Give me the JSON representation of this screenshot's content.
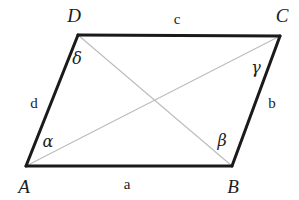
{
  "figure": {
    "background_color": "#ffffff",
    "edge_color": "#1a1a1a",
    "diagonal_color": "#b9b9b9",
    "label_color": "#1c1c1c"
  },
  "vertices": [
    {
      "name": "A",
      "label": "A",
      "x": 26,
      "y": 166,
      "label_x": 24,
      "label_y": 186
    },
    {
      "name": "B",
      "label": "B",
      "x": 232,
      "y": 166,
      "label_x": 233,
      "label_y": 186
    },
    {
      "name": "C",
      "label": "C",
      "x": 280,
      "y": 36,
      "label_x": 282,
      "label_y": 15
    },
    {
      "name": "D",
      "label": "D",
      "x": 78,
      "y": 35,
      "label_x": 74,
      "label_y": 15
    }
  ],
  "sides": [
    {
      "name": "AB",
      "label": "a",
      "label_x": 127,
      "label_y": 184
    },
    {
      "name": "BC",
      "label": "b",
      "label_x": 272,
      "label_y": 103
    },
    {
      "name": "CD",
      "label": "c",
      "label_x": 177,
      "label_y": 19
    },
    {
      "name": "DA",
      "label": "d",
      "label_x": 34,
      "label_y": 103
    }
  ],
  "angles": [
    {
      "name": "alpha",
      "at_vertex": "A",
      "label": "α",
      "label_x": 48,
      "label_y": 142
    },
    {
      "name": "beta",
      "at_vertex": "B",
      "label": "β",
      "label_x": 222,
      "label_y": 141
    },
    {
      "name": "gamma",
      "at_vertex": "C",
      "label": "γ",
      "label_x": 256,
      "label_y": 68
    },
    {
      "name": "delta",
      "at_vertex": "D",
      "label": "δ",
      "label_x": 77,
      "label_y": 59
    }
  ],
  "diagonals": [
    {
      "name": "AC",
      "from": "A",
      "to": "C"
    },
    {
      "name": "BD",
      "from": "B",
      "to": "D"
    }
  ],
  "intersection": {
    "name": "diagonal-intersection",
    "x": 152,
    "y": 101
  }
}
